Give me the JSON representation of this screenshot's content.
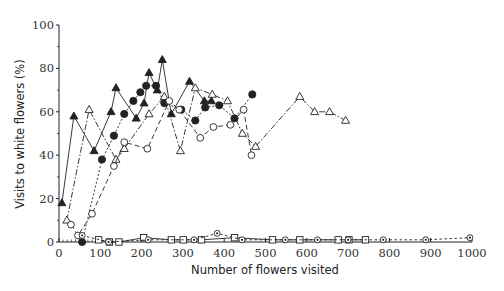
{
  "chart_data": {
    "type": "line",
    "title": "",
    "xlabel": "Number of flowers visited",
    "ylabel": "Visits to white flowers (%)",
    "xlim": [
      0,
      1000
    ],
    "ylim": [
      0,
      100
    ],
    "xticks": [
      0,
      100,
      200,
      300,
      400,
      500,
      600,
      700,
      800,
      900,
      1000
    ],
    "yticks": [
      0,
      20,
      40,
      60,
      80,
      100
    ],
    "grid": false,
    "legend": "none",
    "series": [
      {
        "name": "filled-triangle",
        "marker": "triangle-filled",
        "line": "solid",
        "points": [
          [
            7,
            18
          ],
          [
            36,
            58
          ],
          [
            85,
            42
          ],
          [
            126,
            60
          ],
          [
            138,
            71
          ],
          [
            187,
            57
          ],
          [
            206,
            64
          ],
          [
            218,
            78
          ],
          [
            238,
            70
          ],
          [
            250,
            84
          ],
          [
            272,
            59
          ],
          [
            316,
            74
          ],
          [
            352,
            65
          ],
          [
            369,
            65
          ]
        ]
      },
      {
        "name": "filled-circle",
        "marker": "circle-filled",
        "line": "short-dash",
        "points": [
          [
            56,
            0
          ],
          [
            104,
            38
          ],
          [
            133,
            49
          ],
          [
            158,
            59
          ],
          [
            180,
            65
          ],
          [
            197,
            69
          ],
          [
            211,
            72
          ],
          [
            235,
            72
          ],
          [
            255,
            64
          ],
          [
            296,
            61
          ],
          [
            330,
            56
          ],
          [
            354,
            62
          ],
          [
            388,
            63
          ],
          [
            425,
            57
          ],
          [
            468,
            68
          ]
        ]
      },
      {
        "name": "open-triangle",
        "marker": "triangle-open",
        "line": "dash-dot",
        "points": [
          [
            19,
            10
          ],
          [
            73,
            61
          ],
          [
            138,
            38
          ],
          [
            158,
            43
          ],
          [
            218,
            59
          ],
          [
            255,
            67
          ],
          [
            294,
            42
          ],
          [
            330,
            71
          ],
          [
            371,
            68
          ],
          [
            408,
            65
          ],
          [
            444,
            50
          ],
          [
            476,
            44
          ],
          [
            583,
            67
          ],
          [
            619,
            60
          ],
          [
            655,
            60
          ],
          [
            694,
            56
          ]
        ]
      },
      {
        "name": "open-circle",
        "marker": "circle-open",
        "line": "long-dash",
        "points": [
          [
            29,
            8
          ],
          [
            46,
            3
          ],
          [
            80,
            13
          ],
          [
            133,
            35
          ],
          [
            158,
            46
          ],
          [
            214,
            43
          ],
          [
            267,
            65
          ],
          [
            291,
            61
          ],
          [
            342,
            48
          ],
          [
            374,
            53
          ],
          [
            415,
            54
          ],
          [
            447,
            61
          ],
          [
            466,
            40
          ]
        ]
      },
      {
        "name": "open-square",
        "marker": "square-open",
        "line": "solid",
        "points": [
          [
            96,
            1
          ],
          [
            122,
            0
          ],
          [
            145,
            0
          ],
          [
            205,
            2
          ],
          [
            272,
            1
          ],
          [
            301,
            1
          ],
          [
            345,
            1
          ],
          [
            425,
            2
          ],
          [
            517,
            1
          ],
          [
            583,
            1
          ],
          [
            676,
            1
          ],
          [
            702,
            1
          ],
          [
            742,
            1
          ]
        ]
      },
      {
        "name": "dotted-circle",
        "marker": "circle-dot",
        "line": "dashed",
        "points": [
          [
            56,
            3
          ],
          [
            120,
            0
          ],
          [
            216,
            1
          ],
          [
            327,
            1
          ],
          [
            383,
            4
          ],
          [
            443,
            1
          ],
          [
            548,
            1
          ],
          [
            626,
            1
          ],
          [
            700,
            1
          ],
          [
            785,
            1
          ],
          [
            888,
            1
          ],
          [
            995,
            2
          ]
        ]
      }
    ]
  },
  "axes": {
    "x_title": "Number of flowers visited",
    "y_title": "Visits to white flowers (%)"
  },
  "colors": {
    "ink": "#222222",
    "background": "#ffffff"
  }
}
